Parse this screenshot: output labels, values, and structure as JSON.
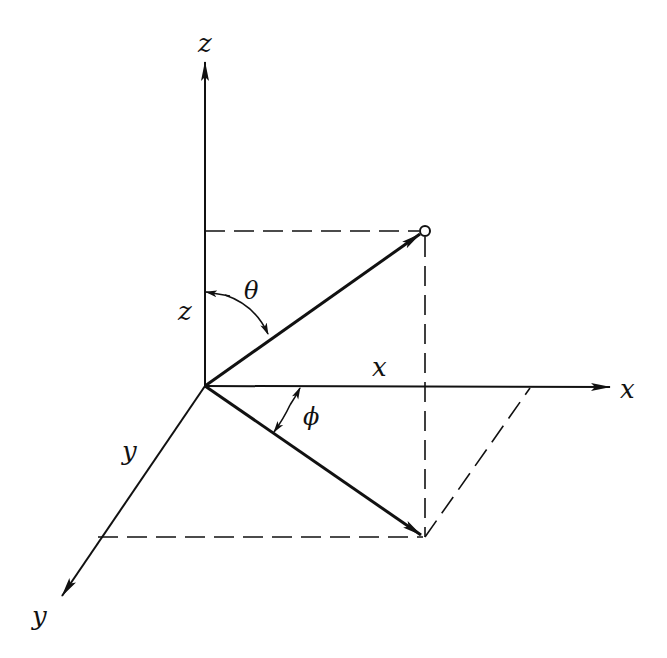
{
  "diagram": {
    "axes": {
      "z": {
        "label": "z"
      },
      "x": {
        "label": "x"
      },
      "y": {
        "label": "y"
      }
    },
    "component_labels": {
      "z": "z",
      "x": "x",
      "y": "y"
    },
    "angles": {
      "theta": "θ",
      "phi": "ϕ"
    },
    "colors": {
      "ink": "#111111",
      "background": "#ffffff"
    }
  }
}
